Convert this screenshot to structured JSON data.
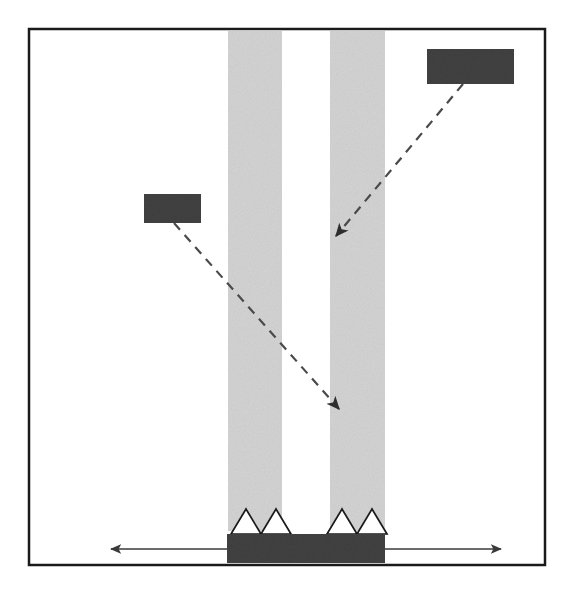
{
  "figure": {
    "canvas": {
      "width": 573,
      "height": 589
    },
    "background_color": "#ffffff"
  },
  "colors": {
    "frame_stroke": "#1a1a1a",
    "stripe_fill": "#d4d4d4",
    "redaction_fill": "#414141",
    "base_fill": "#414141",
    "sawtooth_fill": "#ffffff",
    "sawtooth_stroke": "#1a1a1a",
    "arrow_stroke": "#3a3a3a",
    "leader_stroke": "#4a4a4a"
  },
  "frame": {
    "name": "outer-frame",
    "x": 29,
    "y": 29,
    "width": 516,
    "height": 536,
    "stroke_width": 2.5,
    "fill": "none"
  },
  "stripes": [
    {
      "id": "stripe-left",
      "label": "left vertical band",
      "x": 228,
      "y": 31,
      "width": 54,
      "height": 500
    },
    {
      "id": "stripe-right",
      "label": "right vertical band",
      "x": 330,
      "y": 31,
      "width": 55,
      "height": 500
    }
  ],
  "base": {
    "name": "substrate-base",
    "label": "dark substrate bar",
    "x": 227,
    "y": 534,
    "width": 158,
    "height": 29
  },
  "sawtooth": {
    "label": "triangular sawtooth profile",
    "baseline_y": 534,
    "teeth": [
      {
        "id": "tooth-1",
        "left_x": 231,
        "apex_x": 246,
        "right_x": 261,
        "apex_y": 509
      },
      {
        "id": "tooth-2",
        "left_x": 261,
        "apex_x": 276,
        "right_x": 291,
        "apex_y": 509
      },
      {
        "id": "tooth-3",
        "left_x": 327,
        "apex_x": 342,
        "right_x": 357,
        "apex_y": 509
      },
      {
        "id": "tooth-4",
        "left_x": 357,
        "apex_x": 372,
        "right_x": 387,
        "apex_y": 509
      }
    ]
  },
  "redaction_boxes": [
    {
      "id": "label-box-top-right",
      "name": "redacted-label-top-right",
      "text": "",
      "x": 427,
      "y": 49,
      "width": 87,
      "height": 35
    },
    {
      "id": "label-box-middle-left",
      "name": "redacted-label-middle-left",
      "text": "",
      "x": 144,
      "y": 194,
      "width": 57,
      "height": 29
    }
  ],
  "dashed_arrows": [
    {
      "id": "arrow-from-top-right",
      "name": "dashed-leader-top-right",
      "from_x": 463,
      "from_y": 84,
      "to_x": 336,
      "to_y": 236,
      "dash_pattern": "9 7",
      "stroke_width": 2.2,
      "arrowhead": "end"
    },
    {
      "id": "arrow-from-middle-left",
      "name": "dashed-leader-middle-left",
      "from_x": 174,
      "from_y": 223,
      "to_x": 339,
      "to_y": 409,
      "dash_pattern": "9 7",
      "stroke_width": 2.2,
      "arrowhead": "end"
    }
  ],
  "dimension_arrows": [
    {
      "id": "arrow-left-extent",
      "name": "extent-arrow-left",
      "from_x": 227,
      "from_y": 549,
      "to_x": 111,
      "to_y": 549,
      "direction": "left",
      "stroke_width": 1.6
    },
    {
      "id": "arrow-right-extent",
      "name": "extent-arrow-right",
      "from_x": 385,
      "from_y": 549,
      "to_x": 501,
      "to_y": 549,
      "direction": "right",
      "stroke_width": 1.6
    }
  ]
}
